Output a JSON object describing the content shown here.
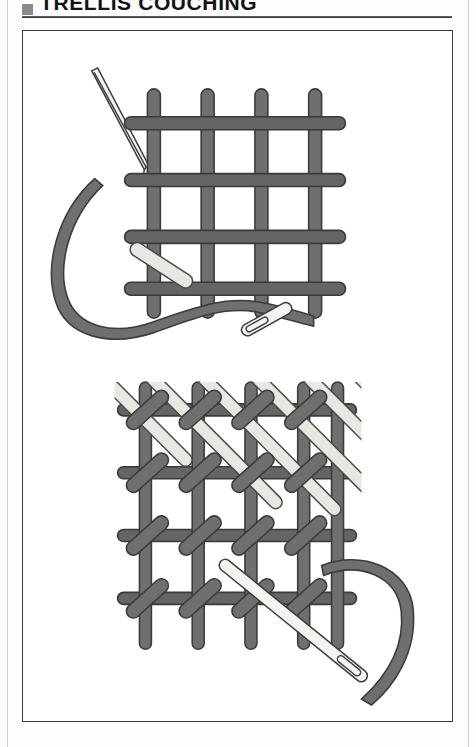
{
  "page": {
    "background_color": "#fdfdfd",
    "rule_color": "#cfcfcf"
  },
  "header": {
    "bullet_icon": "square-bullet-icon",
    "bullet_color": "#8a8a8a",
    "title": "TRELLIS COUCHING",
    "rule_color": "#2b2b2b"
  },
  "figure": {
    "caption": "",
    "border_color": "#3a3a3a",
    "background": "#ffffff",
    "palette": {
      "thread_dark_fill": "#6f6f6f",
      "thread_dark_stroke": "#3c3c3c",
      "thread_light_fill": "#e8e7e2",
      "thread_light_stroke": "#4a4a4a",
      "needle_fill": "#f3f3f0",
      "needle_stroke": "#3c3c3c"
    },
    "diagrams": [
      {
        "name": "top-diagram-laid-grid",
        "description": "Laid grid of dark threads with one diagonal couching stitch worked and needle with thread ready for next",
        "vertical_threads": 4,
        "horizontal_threads": 4,
        "couching_stitches": 1,
        "needles": 2,
        "needle_labels": [
          "spare-needle-upper-left",
          "threaded-needle-lower"
        ]
      },
      {
        "name": "bottom-diagram-completed-trellis",
        "description": "Completed trellis couching: dark laid grid, light diagonal laid threads, dark oval couching stitches at every intersection, needle entering at lower right",
        "vertical_threads": 5,
        "horizontal_threads": 4,
        "diagonal_threads": 7,
        "couching_stitches": 16,
        "needles": 1,
        "needle_labels": [
          "threaded-needle-lower-right"
        ]
      }
    ]
  }
}
